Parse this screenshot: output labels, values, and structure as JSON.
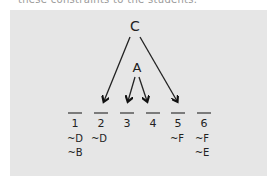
{
  "caption": "these constraints to the students.",
  "diagram": {
    "top_node": "C",
    "middle_node": "A",
    "slots": [
      {
        "label": "1",
        "constraints": [
          "~D",
          "~B"
        ]
      },
      {
        "label": "2",
        "constraints": [
          "~D"
        ]
      },
      {
        "label": "3",
        "constraints": []
      },
      {
        "label": "4",
        "constraints": []
      },
      {
        "label": "5",
        "constraints": [
          "~F"
        ]
      },
      {
        "label": "6",
        "constraints": [
          "~F",
          "~E"
        ]
      }
    ],
    "arrows": [
      {
        "from": "C",
        "to": "2"
      },
      {
        "from": "C",
        "to": "5"
      },
      {
        "from": "A",
        "to": "3"
      },
      {
        "from": "A",
        "to": "4"
      }
    ]
  }
}
